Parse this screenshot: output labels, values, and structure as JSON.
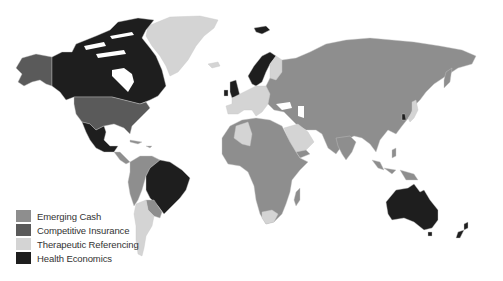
{
  "map": {
    "title": "",
    "colors": {
      "emerging_cash": "#8e8e8e",
      "competitive_insurance": "#5a5a5a",
      "therapeutic_referencing": "#d4d4d4",
      "health_economics": "#1e1e1e",
      "background": "#ffffff",
      "border": "#b8b8b8"
    },
    "regions": {
      "north_america": {
        "canada": "health_economics",
        "usa": "competitive_insurance",
        "alaska": "competitive_insurance",
        "mexico": "health_economics",
        "greenland": "therapeutic_referencing"
      },
      "south_america": {
        "brazil": "health_economics",
        "argentina": "therapeutic_referencing",
        "chile": "therapeutic_referencing",
        "others": "emerging_cash"
      },
      "europe": {
        "uk": "health_economics",
        "ireland": "health_economics",
        "norway": "health_economics",
        "sweden": "health_economics",
        "svalbard": "health_economics",
        "finland": "therapeutic_referencing",
        "western_europe": "therapeutic_referencing",
        "eastern_europe": "emerging_cash"
      },
      "africa": {
        "algeria": "therapeutic_referencing",
        "south_africa": "therapeutic_referencing",
        "others": "emerging_cash"
      },
      "middle_east": {
        "saudi_arabia": "therapeutic_referencing"
      },
      "asia": {
        "russia": "emerging_cash",
        "china": "emerging_cash",
        "india": "emerging_cash",
        "south_korea": "health_economics",
        "japan": "therapeutic_referencing",
        "southeast_asia": "emerging_cash"
      },
      "oceania": {
        "australia": "health_economics",
        "new_zealand": "health_economics"
      }
    }
  },
  "legend": {
    "items": [
      {
        "label": "Emerging Cash",
        "color": "#8e8e8e"
      },
      {
        "label": "Competitive Insurance",
        "color": "#5a5a5a"
      },
      {
        "label": "Therapeutic Referencing",
        "color": "#d4d4d4"
      },
      {
        "label": "Health Economics",
        "color": "#1e1e1e"
      }
    ]
  }
}
